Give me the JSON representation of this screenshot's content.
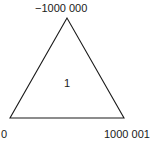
{
  "diagram": {
    "shape": "triangle",
    "vertices": {
      "top": {
        "label": "−1000 000"
      },
      "bottom_left": {
        "label": "0"
      },
      "bottom_right": {
        "label": "1000 001"
      }
    },
    "center": {
      "label": "1"
    },
    "stroke_color": "#1a1a1a",
    "background_color": "#ffffff"
  }
}
